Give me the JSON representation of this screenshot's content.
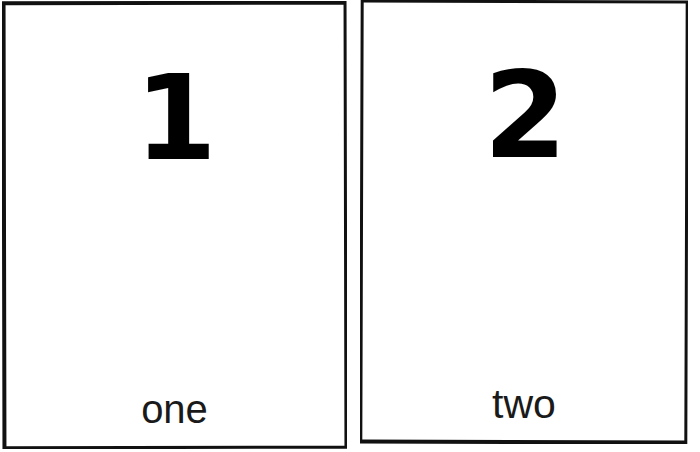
{
  "sheet": {
    "background_color": "#ffffff",
    "card_border_color": "#111111",
    "ink_color": "#000000",
    "word_color": "#1a1a1a"
  },
  "cards": [
    {
      "id": "one",
      "numeral": "1",
      "word": "one"
    },
    {
      "id": "two",
      "numeral": "2",
      "word": "two"
    }
  ]
}
